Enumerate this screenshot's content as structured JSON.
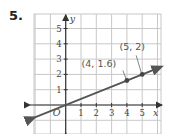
{
  "problem": {
    "number": "5."
  },
  "chart_data": {
    "type": "line",
    "title": "",
    "xlabel": "x",
    "ylabel": "y",
    "origin_label": "O",
    "xlim": [
      -2,
      6
    ],
    "ylim": [
      -2,
      6
    ],
    "grid": true,
    "x_ticks": [
      "1",
      "2",
      "3",
      "4",
      "5"
    ],
    "y_ticks": [
      "1",
      "2",
      "3",
      "4",
      "5"
    ],
    "series": [
      {
        "name": "line",
        "equation": "y = 0.4x",
        "x": [
          -2,
          6
        ],
        "y": [
          -0.8,
          2.4
        ],
        "color": "#555555"
      }
    ],
    "points": [
      {
        "x": 4,
        "y": 1.6,
        "label": "(4, 1.6)"
      },
      {
        "x": 5,
        "y": 2,
        "label": "(5, 2)"
      }
    ],
    "colors": {
      "grid": "#c8c8c8",
      "axis": "#333333",
      "line": "#555555",
      "text": "#444444"
    }
  }
}
